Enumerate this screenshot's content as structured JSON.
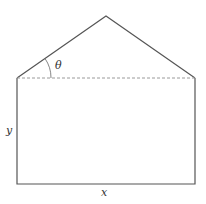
{
  "diagram": {
    "type": "geometry-figure",
    "labels": {
      "theta": "θ",
      "y": "y",
      "x": "x"
    },
    "colors": {
      "stroke": "#555555",
      "dashed": "#9a9a9a",
      "text": "#333333",
      "background": "#ffffff"
    },
    "shapes": {
      "rectangle": {
        "width_label": "x",
        "height_label": "y"
      },
      "triangle": {
        "base_angle_label": "θ",
        "base": "dashed line"
      }
    }
  }
}
